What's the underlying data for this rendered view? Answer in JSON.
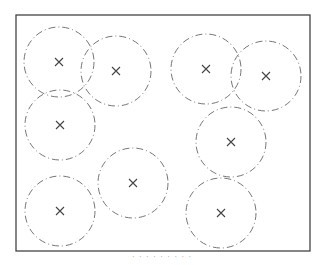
{
  "diagram": {
    "frame": {
      "x": 16,
      "y": 15,
      "width": 294,
      "height": 236,
      "stroke": "#444444"
    },
    "circle_stroke": "#666666",
    "radius": 35,
    "circles": [
      {
        "cx": 59,
        "cy": 62
      },
      {
        "cx": 116,
        "cy": 71
      },
      {
        "cx": 206,
        "cy": 69
      },
      {
        "cx": 266,
        "cy": 76
      },
      {
        "cx": 60,
        "cy": 125
      },
      {
        "cx": 231,
        "cy": 142
      },
      {
        "cx": 133,
        "cy": 183
      },
      {
        "cx": 60,
        "cy": 211
      },
      {
        "cx": 221,
        "cy": 213
      }
    ],
    "marker": "×"
  },
  "caption": "· · · · · · · · ·"
}
